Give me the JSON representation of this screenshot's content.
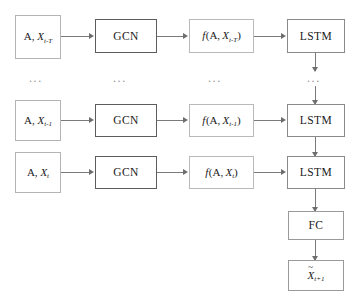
{
  "diagram": {
    "rows": [
      {
        "id": "row-t-minus-T",
        "input": {
          "prefix": "A,",
          "var": "X",
          "sub": "t-T"
        },
        "gcn": "GCN",
        "fn": {
          "f": "f",
          "open": "(",
          "prefix": "A,",
          "var": "X",
          "sub": "t-T",
          "close": ")"
        },
        "lstm": "LSTM"
      },
      {
        "id": "row-t-minus-1",
        "input": {
          "prefix": "A,",
          "var": "X",
          "sub": "t-1"
        },
        "gcn": "GCN",
        "fn": {
          "f": "f",
          "open": "(",
          "prefix": "A,",
          "var": "X",
          "sub": "t-1",
          "close": ")"
        },
        "lstm": "LSTM"
      },
      {
        "id": "row-t",
        "input": {
          "prefix": "A,",
          "var": "X",
          "sub": "t"
        },
        "gcn": "GCN",
        "fn": {
          "f": "f",
          "open": "(",
          "prefix": "A,",
          "var": "X",
          "sub": "t",
          "close": ")"
        },
        "lstm": "LSTM"
      }
    ],
    "ellipses": {
      "input_column": "...",
      "gcn_column": "...",
      "fn_column": "...",
      "lstm_column": "..."
    },
    "fc": {
      "label": "FC"
    },
    "output": {
      "accent": "~",
      "var": "X",
      "sub": "t+1"
    },
    "colors": {
      "background": "#ffffff",
      "text": "#1a1a1a",
      "connector": "#7a7a7a",
      "arrow": "#6e6e6e",
      "border_input": "#b4b4b4",
      "border_gcn": "#5c5c5c",
      "border_fn": "#b9b9b9",
      "border_lstm": "#8a8a8a",
      "border_fc": "#9a9a9a",
      "ellipsis": "#909090"
    }
  }
}
